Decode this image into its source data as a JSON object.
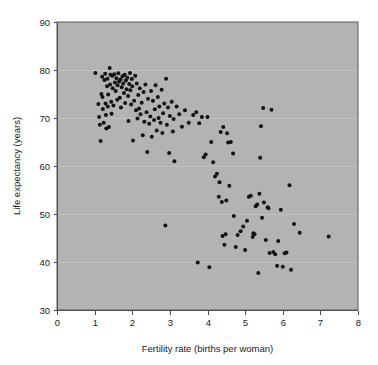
{
  "chart_data": {
    "type": "scatter",
    "title": "",
    "xlabel": "Fertility rate (births per woman)",
    "ylabel": "Life expectancy (years)",
    "xlim": [
      0,
      8
    ],
    "ylim": [
      30,
      90
    ],
    "xticks": [
      0,
      1,
      2,
      3,
      4,
      5,
      6,
      7,
      8
    ],
    "yticks": [
      30,
      40,
      50,
      60,
      70,
      80,
      90
    ],
    "xtick_labels": [
      "0",
      "1",
      "2",
      "3",
      "4",
      "5",
      "6",
      "7",
      "8"
    ],
    "ytick_labels": [
      "30",
      "40",
      "50",
      "60",
      "70",
      "80",
      "90"
    ],
    "grid": "horizontal",
    "legend": "none",
    "plot_background_color": "#b3b3b3",
    "figure_background_color": "#ffffff",
    "marker_color": "#111111",
    "marker_shape": "circle",
    "marker_size_px": 3.2,
    "point_count": 166,
    "points": [
      [
        1.02,
        79.4
      ],
      [
        1.1,
        72.9
      ],
      [
        1.12,
        70.2
      ],
      [
        1.14,
        68.6
      ],
      [
        1.16,
        65.2
      ],
      [
        1.18,
        75.0
      ],
      [
        1.2,
        78.6
      ],
      [
        1.21,
        74.4
      ],
      [
        1.22,
        71.9
      ],
      [
        1.24,
        69.0
      ],
      [
        1.26,
        77.9
      ],
      [
        1.28,
        79.2
      ],
      [
        1.29,
        73.0
      ],
      [
        1.3,
        70.6
      ],
      [
        1.31,
        67.8
      ],
      [
        1.33,
        76.6
      ],
      [
        1.34,
        78.2
      ],
      [
        1.35,
        72.4
      ],
      [
        1.36,
        74.9
      ],
      [
        1.38,
        68.1
      ],
      [
        1.4,
        80.4
      ],
      [
        1.41,
        77.0
      ],
      [
        1.42,
        79.0
      ],
      [
        1.44,
        73.4
      ],
      [
        1.45,
        70.9
      ],
      [
        1.47,
        78.8
      ],
      [
        1.48,
        76.2
      ],
      [
        1.5,
        72.6
      ],
      [
        1.52,
        79.1
      ],
      [
        1.54,
        77.4
      ],
      [
        1.56,
        75.6
      ],
      [
        1.58,
        78.3
      ],
      [
        1.6,
        73.8
      ],
      [
        1.61,
        76.8
      ],
      [
        1.63,
        79.3
      ],
      [
        1.65,
        77.6
      ],
      [
        1.67,
        74.2
      ],
      [
        1.69,
        78.0
      ],
      [
        1.7,
        72.2
      ],
      [
        1.72,
        76.4
      ],
      [
        1.74,
        78.7
      ],
      [
        1.76,
        77.2
      ],
      [
        1.78,
        75.2
      ],
      [
        1.8,
        79.0
      ],
      [
        1.81,
        73.1
      ],
      [
        1.83,
        77.8
      ],
      [
        1.85,
        76.0
      ],
      [
        1.87,
        78.4
      ],
      [
        1.89,
        74.6
      ],
      [
        1.9,
        69.4
      ],
      [
        1.92,
        77.1
      ],
      [
        1.94,
        79.4
      ],
      [
        1.95,
        75.8
      ],
      [
        1.97,
        72.8
      ],
      [
        1.99,
        78.1
      ],
      [
        2.0,
        76.6
      ],
      [
        2.02,
        65.3
      ],
      [
        2.05,
        73.6
      ],
      [
        2.08,
        78.8
      ],
      [
        2.1,
        71.6
      ],
      [
        2.12,
        77.2
      ],
      [
        2.14,
        69.9
      ],
      [
        2.16,
        74.8
      ],
      [
        2.18,
        72.0
      ],
      [
        2.2,
        76.2
      ],
      [
        2.22,
        70.8
      ],
      [
        2.25,
        73.2
      ],
      [
        2.28,
        66.4
      ],
      [
        2.3,
        75.4
      ],
      [
        2.32,
        69.2
      ],
      [
        2.35,
        77.0
      ],
      [
        2.38,
        71.2
      ],
      [
        2.4,
        62.9
      ],
      [
        2.42,
        74.0
      ],
      [
        2.45,
        68.8
      ],
      [
        2.48,
        70.3
      ],
      [
        2.5,
        75.6
      ],
      [
        2.52,
        66.1
      ],
      [
        2.55,
        73.6
      ],
      [
        2.58,
        69.6
      ],
      [
        2.6,
        71.8
      ],
      [
        2.62,
        76.8
      ],
      [
        2.65,
        67.4
      ],
      [
        2.68,
        74.4
      ],
      [
        2.7,
        70.0
      ],
      [
        2.72,
        72.4
      ],
      [
        2.75,
        69.0
      ],
      [
        2.78,
        75.9
      ],
      [
        2.8,
        66.9
      ],
      [
        2.82,
        71.0
      ],
      [
        2.85,
        73.0
      ],
      [
        2.88,
        47.6
      ],
      [
        2.9,
        78.2
      ],
      [
        2.92,
        68.6
      ],
      [
        2.95,
        72.2
      ],
      [
        2.98,
        62.7
      ],
      [
        3.0,
        70.4
      ],
      [
        3.05,
        73.4
      ],
      [
        3.08,
        67.2
      ],
      [
        3.1,
        69.8
      ],
      [
        3.12,
        61.0
      ],
      [
        3.18,
        72.4
      ],
      [
        3.25,
        70.8
      ],
      [
        3.32,
        68.2
      ],
      [
        3.4,
        71.6
      ],
      [
        3.5,
        69.0
      ],
      [
        3.62,
        70.6
      ],
      [
        3.7,
        71.2
      ],
      [
        3.74,
        39.9
      ],
      [
        3.78,
        68.9
      ],
      [
        3.85,
        70.2
      ],
      [
        3.9,
        61.8
      ],
      [
        3.95,
        62.4
      ],
      [
        4.0,
        70.2
      ],
      [
        4.05,
        38.9
      ],
      [
        4.1,
        65.0
      ],
      [
        4.15,
        60.8
      ],
      [
        4.2,
        57.8
      ],
      [
        4.25,
        58.4
      ],
      [
        4.3,
        53.6
      ],
      [
        4.32,
        56.6
      ],
      [
        4.35,
        67.1
      ],
      [
        4.38,
        52.5
      ],
      [
        4.4,
        45.4
      ],
      [
        4.42,
        68.1
      ],
      [
        4.45,
        43.6
      ],
      [
        4.48,
        45.8
      ],
      [
        4.5,
        52.8
      ],
      [
        4.52,
        66.8
      ],
      [
        4.55,
        64.9
      ],
      [
        4.58,
        55.9
      ],
      [
        4.62,
        65.0
      ],
      [
        4.68,
        62.6
      ],
      [
        4.7,
        49.6
      ],
      [
        4.75,
        43.1
      ],
      [
        4.8,
        45.6
      ],
      [
        4.88,
        46.4
      ],
      [
        4.95,
        47.4
      ],
      [
        5.0,
        42.5
      ],
      [
        5.05,
        48.6
      ],
      [
        5.1,
        53.6
      ],
      [
        5.15,
        53.8
      ],
      [
        5.2,
        45.2
      ],
      [
        5.22,
        46.0
      ],
      [
        5.25,
        45.8
      ],
      [
        5.28,
        51.6
      ],
      [
        5.32,
        52.0
      ],
      [
        5.35,
        37.7
      ],
      [
        5.38,
        54.2
      ],
      [
        5.4,
        61.7
      ],
      [
        5.42,
        68.3
      ],
      [
        5.45,
        49.2
      ],
      [
        5.48,
        72.1
      ],
      [
        5.5,
        52.4
      ],
      [
        5.55,
        44.6
      ],
      [
        5.6,
        51.4
      ],
      [
        5.62,
        51.2
      ],
      [
        5.65,
        41.9
      ],
      [
        5.7,
        71.7
      ],
      [
        5.75,
        42.1
      ],
      [
        5.8,
        41.6
      ],
      [
        5.85,
        39.2
      ],
      [
        5.88,
        44.4
      ],
      [
        5.95,
        50.9
      ],
      [
        6.0,
        39.0
      ],
      [
        6.05,
        41.8
      ],
      [
        6.1,
        42.0
      ],
      [
        6.18,
        56.0
      ],
      [
        6.22,
        38.4
      ],
      [
        6.3,
        47.9
      ],
      [
        6.45,
        46.1
      ],
      [
        7.22,
        45.3
      ]
    ]
  },
  "axis_title_x": "Fertility rate (births per woman)",
  "axis_title_y": "Life expectancy (years)"
}
